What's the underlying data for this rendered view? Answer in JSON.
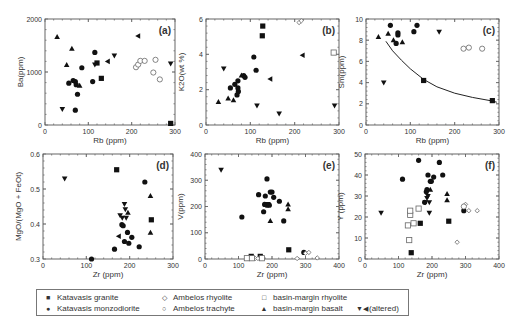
{
  "figure": {
    "legend": [
      {
        "symbol": "■",
        "marker": "filled-square",
        "label": "Katavasis granite"
      },
      {
        "symbol": "●",
        "marker": "filled-circle",
        "label": "Katavasis monzodiorite"
      },
      {
        "symbol": "◇",
        "marker": "open-diamond",
        "label": "Ambelos rhyolite"
      },
      {
        "symbol": "○",
        "marker": "open-circle",
        "label": "Ambelos trachyte"
      },
      {
        "symbol": "□",
        "marker": "open-square",
        "label": "basin-margin rhyolite"
      },
      {
        "symbol": "▲",
        "marker": "filled-triangle",
        "label": "basin-margin basalt"
      },
      {
        "symbol": "▼◀",
        "marker": "filled-down-left-triangles",
        "label": "(altered)"
      }
    ]
  },
  "chart_data": [
    {
      "panel": "(a)",
      "type": "scatter",
      "xlabel": "Rb (ppm)",
      "ylabel": "Ba(ppm)",
      "xlim": [
        0,
        300
      ],
      "ylim": [
        0,
        2000
      ],
      "xticks": [
        0,
        100,
        200,
        300
      ],
      "yticks": [
        0,
        1000,
        2000
      ],
      "frame": {
        "x0": 45,
        "y0": 19,
        "x1": 175,
        "y1": 125
      },
      "series": [
        {
          "name": "Katavasis granite",
          "marker": "sq",
          "points": [
            [
              120,
              1170
            ],
            [
              130,
              880
            ],
            [
              290,
              30
            ]
          ]
        },
        {
          "name": "Katavasis monzodiorite",
          "marker": "ci",
          "points": [
            [
              55,
              790
            ],
            [
              65,
              840
            ],
            [
              70,
              820
            ],
            [
              72,
              760
            ],
            [
              75,
              580
            ],
            [
              70,
              280
            ],
            [
              85,
              1080
            ],
            [
              110,
              820
            ],
            [
              115,
              1370
            ]
          ]
        },
        {
          "name": "Ambelos trachyte",
          "marker": "oc",
          "points": [
            [
              210,
              1090
            ],
            [
              215,
              1140
            ],
            [
              220,
              1210
            ],
            [
              230,
              1210
            ],
            [
              250,
              990
            ],
            [
              255,
              1230
            ],
            [
              265,
              860
            ]
          ]
        },
        {
          "name": "basin-margin basalt",
          "marker": "tu",
          "points": [
            [
              28,
              1660
            ],
            [
              50,
              1130
            ],
            [
              62,
              1440
            ],
            [
              80,
              740
            ]
          ]
        },
        {
          "name": "altered (down)",
          "marker": "td",
          "points": [
            [
              40,
              300
            ],
            [
              115,
              1140
            ],
            [
              160,
              1310
            ],
            [
              290,
              1160
            ]
          ]
        },
        {
          "name": "altered (left)",
          "marker": "tl",
          "points": [
            [
              145,
              1200
            ],
            [
              215,
              1680
            ]
          ]
        }
      ]
    },
    {
      "panel": "(b)",
      "type": "scatter",
      "xlabel": "Rb (ppm)",
      "ylabel": "K2O(wt %)",
      "xlim": [
        0,
        300
      ],
      "ylim": [
        0,
        6
      ],
      "xticks": [
        0,
        100,
        200,
        300
      ],
      "yticks": [
        0,
        2,
        4,
        6
      ],
      "frame": {
        "x0": 206,
        "y0": 19,
        "x1": 339,
        "y1": 125
      },
      "series": [
        {
          "name": "Katavasis granite",
          "marker": "sq",
          "points": [
            [
              128,
              5.6
            ],
            [
              127,
              5.05
            ]
          ]
        },
        {
          "name": "Katavasis monzodiorite",
          "marker": "ci",
          "points": [
            [
              55,
              2.1
            ],
            [
              65,
              2.3
            ],
            [
              70,
              1.7
            ],
            [
              72,
              2.5
            ],
            [
              72,
              2.1
            ],
            [
              73,
              1.9
            ],
            [
              85,
              2.8
            ],
            [
              88,
              2.7
            ],
            [
              108,
              3.85
            ],
            [
              113,
              3.1
            ]
          ]
        },
        {
          "name": "Ambelos rhyolite",
          "marker": "od",
          "points": [
            [
              210,
              5.8
            ],
            [
              215,
              5.9
            ]
          ]
        },
        {
          "name": "basin-margin rhyolite",
          "marker": "os",
          "points": [
            [
              288,
              4.1
            ]
          ]
        },
        {
          "name": "basin-margin basalt",
          "marker": "tu",
          "points": [
            [
              28,
              1.3
            ],
            [
              50,
              1.5
            ],
            [
              62,
              1.4
            ],
            [
              80,
              2.8
            ]
          ]
        },
        {
          "name": "altered (down)",
          "marker": "td",
          "points": [
            [
              40,
              3.2
            ],
            [
              115,
              1.1
            ],
            [
              165,
              0.65
            ],
            [
              290,
              1.1
            ]
          ]
        },
        {
          "name": "altered (left)",
          "marker": "tl",
          "points": [
            [
              145,
              2.6
            ],
            [
              218,
              3.95
            ]
          ]
        }
      ]
    },
    {
      "panel": "(c)",
      "type": "scatter",
      "xlabel": "Rb (ppm)",
      "ylabel": "Sm(ppm)",
      "xlim": [
        0,
        300
      ],
      "ylim": [
        0,
        10
      ],
      "xticks": [
        0,
        100,
        200,
        300
      ],
      "yticks": [
        0,
        2,
        4,
        6,
        8,
        10
      ],
      "frame": {
        "x0": 366,
        "y0": 19,
        "x1": 499,
        "y1": 125
      },
      "curve": [
        [
          45,
          7.9
        ],
        [
          60,
          7.0
        ],
        [
          80,
          6.1
        ],
        [
          100,
          5.3
        ],
        [
          130,
          4.3
        ],
        [
          160,
          3.6
        ],
        [
          200,
          3.0
        ],
        [
          240,
          2.6
        ],
        [
          280,
          2.3
        ],
        [
          295,
          2.15
        ]
      ],
      "series": [
        {
          "name": "Katavasis granite",
          "marker": "sq",
          "points": [
            [
              130,
              4.2
            ],
            [
              285,
              2.3
            ]
          ]
        },
        {
          "name": "Katavasis monzodiorite",
          "marker": "ci",
          "points": [
            [
              55,
              9.4
            ],
            [
              68,
              7.7
            ],
            [
              72,
              8.5
            ],
            [
              72,
              8.7
            ],
            [
              108,
              8.8
            ],
            [
              115,
              9.4
            ]
          ]
        },
        {
          "name": "Ambelos trachyte",
          "marker": "oc",
          "points": [
            [
              220,
              7.2
            ],
            [
              232,
              7.3
            ],
            [
              262,
              7.2
            ]
          ]
        },
        {
          "name": "basin-margin basalt",
          "marker": "tu",
          "points": [
            [
              28,
              8.3
            ],
            [
              50,
              8.6
            ],
            [
              62,
              8.0
            ],
            [
              82,
              7.8
            ]
          ]
        },
        {
          "name": "altered (down)",
          "marker": "td",
          "points": [
            [
              40,
              4.0
            ],
            [
              165,
              8.8
            ]
          ]
        }
      ]
    },
    {
      "panel": "(d)",
      "type": "scatter",
      "xlabel": "Zr (ppm)",
      "ylabel": "MgO/(MgO + FeOt)",
      "xlim": [
        0,
        300
      ],
      "ylim": [
        0.3,
        0.6
      ],
      "xticks": [
        0,
        100,
        200,
        300
      ],
      "yticks": [
        0.3,
        0.4,
        0.5,
        0.6
      ],
      "frame": {
        "x0": 43,
        "y0": 154,
        "x1": 173,
        "y1": 259
      },
      "series": [
        {
          "name": "Katavasis granite",
          "marker": "sq",
          "points": [
            [
              170,
              0.555
            ],
            [
              250,
              0.412
            ]
          ]
        },
        {
          "name": "Katavasis monzodiorite",
          "marker": "ci",
          "points": [
            [
              112,
              0.3
            ],
            [
              165,
              0.328
            ],
            [
              182,
              0.398
            ],
            [
              185,
              0.395
            ],
            [
              188,
              0.35
            ],
            [
              195,
              0.376
            ],
            [
              198,
              0.345
            ],
            [
              205,
              0.362
            ],
            [
              222,
              0.335
            ],
            [
              235,
              0.52
            ]
          ]
        },
        {
          "name": "basin-margin basalt",
          "marker": "tu",
          "points": [
            [
              196,
              0.432
            ],
            [
              248,
              0.48
            ],
            [
              248,
              0.375
            ]
          ]
        },
        {
          "name": "altered (down)",
          "marker": "td",
          "points": [
            [
              50,
              0.53
            ],
            [
              178,
              0.425
            ],
            [
              183,
              0.418
            ],
            [
              188,
              0.457
            ],
            [
              190,
              0.442
            ],
            [
              192,
              0.418
            ]
          ]
        },
        {
          "name": "altered (left)",
          "marker": "tl",
          "points": [
            [
              175,
              0.365
            ]
          ]
        }
      ]
    },
    {
      "panel": "(e)",
      "type": "scatter",
      "xlabel": "Zr (ppm)",
      "ylabel": "V(ppm)",
      "xlim": [
        0,
        400
      ],
      "ylim": [
        0,
        400
      ],
      "xticks": [
        0,
        100,
        200,
        300,
        400
      ],
      "yticks": [
        0,
        100,
        200,
        300,
        400
      ],
      "frame": {
        "x0": 205,
        "y0": 154,
        "x1": 339,
        "y1": 259
      },
      "series": [
        {
          "name": "Katavasis granite",
          "marker": "sq",
          "points": [
            [
              138,
              10
            ],
            [
              165,
              10
            ],
            [
              250,
              35
            ]
          ]
        },
        {
          "name": "Katavasis monzodiorite",
          "marker": "ci",
          "points": [
            [
              110,
              160
            ],
            [
              160,
              245
            ],
            [
              175,
              180
            ],
            [
              180,
              240
            ],
            [
              185,
              305
            ],
            [
              178,
              208
            ],
            [
              185,
              205
            ],
            [
              192,
              205
            ],
            [
              195,
              255
            ],
            [
              200,
              255
            ],
            [
              205,
              235
            ],
            [
              222,
              220
            ],
            [
              235,
              145
            ],
            [
              295,
              25
            ]
          ]
        },
        {
          "name": "Ambelos rhyolite",
          "marker": "od",
          "points": [
            [
              128,
              2
            ],
            [
              132,
              2
            ],
            [
              150,
              2
            ],
            [
              158,
              2
            ],
            [
              275,
              2
            ],
            [
              300,
              22
            ],
            [
              310,
              25
            ],
            [
              335,
              4
            ]
          ]
        },
        {
          "name": "basin-margin rhyolite",
          "marker": "os",
          "points": [
            [
              125,
              3
            ],
            [
              140,
              3
            ],
            [
              170,
              3
            ]
          ]
        },
        {
          "name": "basin-margin basalt",
          "marker": "tu",
          "points": [
            [
              195,
              145
            ],
            [
              248,
              208
            ],
            [
              248,
              190
            ]
          ]
        },
        {
          "name": "altered (down)",
          "marker": "td",
          "points": [
            [
              48,
              340
            ],
            [
              188,
              210
            ]
          ]
        }
      ]
    },
    {
      "panel": "(f)",
      "type": "scatter",
      "xlabel": "Zr (ppm)",
      "ylabel": "Y (ppm)",
      "xlim": [
        0,
        400
      ],
      "ylim": [
        0,
        50
      ],
      "xticks": [
        0,
        100,
        200,
        300,
        400
      ],
      "yticks": [
        0,
        10,
        20,
        30,
        40,
        50
      ],
      "frame": {
        "x0": 365,
        "y0": 154,
        "x1": 499,
        "y1": 259
      },
      "series": [
        {
          "name": "Katavasis granite",
          "marker": "sq",
          "points": [
            [
              138,
              3
            ],
            [
              165,
              17
            ],
            [
              250,
              18
            ]
          ]
        },
        {
          "name": "Katavasis monzodiorite",
          "marker": "ci",
          "points": [
            [
              112,
              38
            ],
            [
              160,
              47
            ],
            [
              178,
              27
            ],
            [
              183,
              32
            ],
            [
              185,
              33
            ],
            [
              188,
              40
            ],
            [
              195,
              37
            ],
            [
              198,
              37
            ],
            [
              205,
              39
            ],
            [
              222,
              46
            ],
            [
              232,
              40
            ],
            [
              295,
              23
            ]
          ]
        },
        {
          "name": "Ambelos rhyolite",
          "marker": "od",
          "points": [
            [
              275,
              8
            ],
            [
              300,
              26
            ],
            [
              310,
              23
            ],
            [
              335,
              23
            ]
          ]
        },
        {
          "name": "Ambelos trachyte",
          "marker": "oc",
          "points": [
            [
              295,
              25
            ]
          ]
        },
        {
          "name": "basin-margin rhyolite",
          "marker": "os",
          "points": [
            [
              128,
              16
            ],
            [
              132,
              9
            ],
            [
              135,
              21
            ],
            [
              135,
              23
            ],
            [
              145,
              17
            ],
            [
              160,
              24
            ]
          ]
        },
        {
          "name": "basin-margin basalt",
          "marker": "tu",
          "points": [
            [
              195,
              33
            ],
            [
              245,
              31
            ],
            [
              245,
              28
            ]
          ]
        },
        {
          "name": "altered (down)",
          "marker": "td",
          "points": [
            [
              48,
              22
            ],
            [
              180,
              27
            ],
            [
              185,
              29
            ],
            [
              188,
              30
            ],
            [
              192,
              27
            ],
            [
              192,
              22
            ]
          ]
        }
      ]
    }
  ]
}
